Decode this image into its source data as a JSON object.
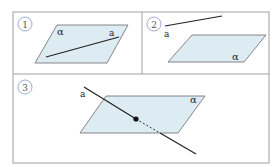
{
  "colors": {
    "border": "#9a9a9a",
    "plane_fill": "#dcecf2",
    "plane_stroke": "#6a6a6a",
    "line": "#222222",
    "badge": "#7d88c8"
  },
  "panels": [
    {
      "number": "1",
      "plane_label": "α",
      "line_label": "a",
      "relation": "line lies in plane"
    },
    {
      "number": "2",
      "plane_label": "α",
      "line_label": "a",
      "relation": "line parallel to plane"
    },
    {
      "number": "3",
      "plane_label": "α",
      "line_label": "a",
      "relation": "line intersects plane"
    }
  ]
}
